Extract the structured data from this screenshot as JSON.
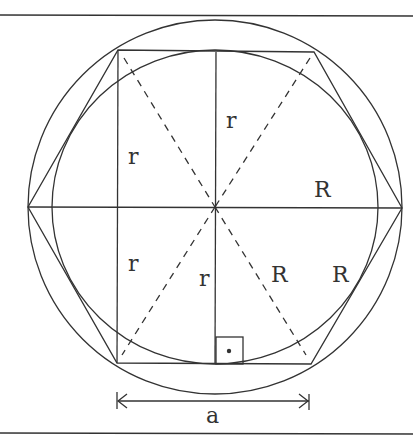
{
  "diagram": {
    "labels": {
      "r_top": "r",
      "r_left_upper": "r",
      "r_left_lower": "r",
      "r_center_lower": "r",
      "R_right_upper": "R",
      "R_center_right": "R",
      "R_right_lower": "R",
      "side_a": "a"
    },
    "stroke_color": "#333333"
  }
}
